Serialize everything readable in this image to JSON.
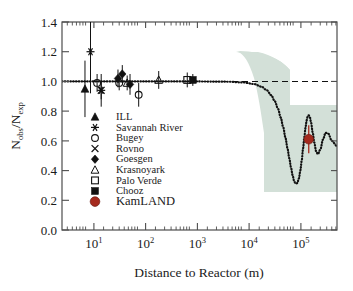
{
  "figure": {
    "background": "#ffffff",
    "frame_color": "#4d4d4d",
    "axes": {
      "x": {
        "title": "Distance to Reactor (m)",
        "scale": "log",
        "range": [
          3.16,
          630957
        ],
        "tick_bases": [
          "10",
          "10",
          "10",
          "10",
          "10"
        ],
        "tick_exponents": [
          "1",
          "2",
          "3",
          "4",
          "5"
        ],
        "tick_values": [
          10,
          100,
          1000,
          10000,
          100000
        ]
      },
      "y": {
        "title_main": "N",
        "title_sub1": "obs",
        "title_slash": "/N",
        "title_sub2": "exp",
        "title_plain": "Nobs/Nexp",
        "range": [
          0.0,
          1.4
        ],
        "ticks": [
          "0.0",
          "0.2",
          "0.4",
          "0.6",
          "0.8",
          "1.0",
          "1.2",
          "1.4"
        ],
        "tick_values": [
          0.0,
          0.2,
          0.4,
          0.6,
          0.8,
          1.0,
          1.2,
          1.4
        ]
      }
    },
    "reference_line": {
      "name": "no-oscillation-line",
      "y_value": 1.0,
      "style": "dashed",
      "color": "#111111"
    },
    "band": {
      "name": "oscillation-uncertainty-band",
      "color": "#d3e0d8",
      "label": "best-fit uncertainty region"
    },
    "curve": {
      "name": "oscillation-survival-curve",
      "style": "dotted",
      "color": "#111111"
    }
  },
  "legend": {
    "items": [
      {
        "label": "ILL",
        "marker": "filled-triangle-up",
        "color": "#111111"
      },
      {
        "label": "Savannah River",
        "marker": "asterisk",
        "color": "#111111"
      },
      {
        "label": "Bugey",
        "marker": "open-circle",
        "color": "#111111"
      },
      {
        "label": "Rovno",
        "marker": "cross-x",
        "color": "#111111"
      },
      {
        "label": "Goesgen",
        "marker": "filled-diamond",
        "color": "#111111"
      },
      {
        "label": "Krasnoyark",
        "marker": "open-triangle-up",
        "color": "#111111"
      },
      {
        "label": "Palo Verde",
        "marker": "open-square",
        "color": "#111111"
      },
      {
        "label": "Chooz",
        "marker": "filled-square",
        "color": "#111111"
      },
      {
        "label": "KamLAND",
        "marker": "filled-circle",
        "color": "#a52a1e",
        "emphasis": true
      }
    ]
  },
  "chart_data": {
    "type": "scatter",
    "title": "",
    "xlabel": "Distance to Reactor (m)",
    "ylabel": "Nobs/Nexp",
    "xscale": "log",
    "xlim": [
      3.16,
      630957
    ],
    "ylim": [
      0.0,
      1.4
    ],
    "grid": false,
    "legend_position": "inside-left",
    "reference_line_y": 1.0,
    "series": [
      {
        "name": "ILL",
        "marker": "filled-triangle-up",
        "color": "#111111",
        "points": [
          {
            "x": 8.76,
            "y": 0.95,
            "yerr": 0.19
          }
        ]
      },
      {
        "name": "Savannah River",
        "marker": "asterisk",
        "color": "#111111",
        "points": [
          {
            "x": 18.0,
            "y": 0.94,
            "yerr": 0.11
          },
          {
            "x": 11.2,
            "y": 1.2,
            "yerr": 0.28
          }
        ]
      },
      {
        "name": "Bugey",
        "marker": "open-circle",
        "color": "#111111",
        "points": [
          {
            "x": 15.0,
            "y": 0.99,
            "yerr": 0.06
          },
          {
            "x": 40.0,
            "y": 0.99,
            "yerr": 0.05
          },
          {
            "x": 95.0,
            "y": 0.91,
            "yerr": 0.08
          }
        ]
      },
      {
        "name": "Rovno",
        "marker": "cross-x",
        "color": "#111111",
        "points": [
          {
            "x": 18.0,
            "y": 0.94,
            "yerr": 0.06
          }
        ]
      },
      {
        "name": "Goesgen",
        "marker": "filled-diamond",
        "color": "#111111",
        "points": [
          {
            "x": 37.9,
            "y": 1.02,
            "yerr": 0.06
          },
          {
            "x": 45.9,
            "y": 1.05,
            "yerr": 0.06
          },
          {
            "x": 64.7,
            "y": 0.98,
            "yerr": 0.07
          }
        ]
      },
      {
        "name": "Krasnoyark",
        "marker": "open-triangle-up",
        "color": "#111111",
        "points": [
          {
            "x": 57.0,
            "y": 0.99,
            "yerr": 0.05
          },
          {
            "x": 231.0,
            "y": 1.01,
            "yerr": 0.06
          }
        ]
      },
      {
        "name": "Palo Verde",
        "marker": "open-square",
        "color": "#111111",
        "points": [
          {
            "x": 820.0,
            "y": 1.01,
            "yerr": 0.05
          }
        ]
      },
      {
        "name": "Chooz",
        "marker": "filled-square",
        "color": "#111111",
        "points": [
          {
            "x": 1050.0,
            "y": 1.01,
            "yerr": 0.04
          }
        ]
      },
      {
        "name": "KamLAND",
        "marker": "filled-circle",
        "color": "#a52a1e",
        "points": [
          {
            "x": 180000.0,
            "y": 0.611,
            "yerr": 0.094
          }
        ]
      }
    ],
    "oscillation_curve": {
      "name": "survival probability best fit",
      "style": "dotted",
      "x": [
        3.16,
        100,
        1000,
        5000,
        10000,
        16000,
        22000,
        28000,
        34000,
        40000,
        46000,
        52000,
        58000,
        64000,
        70000,
        76000,
        82000,
        88000,
        94000,
        100000,
        108000,
        116000,
        124000,
        132000,
        140000,
        148000,
        156000,
        164000,
        172000,
        180000,
        190000,
        200000,
        215000,
        230000,
        250000,
        270000,
        300000,
        340000,
        380000,
        430000,
        500000,
        630957
      ],
      "y": [
        1.0,
        1.0,
        1.0,
        0.998,
        0.993,
        0.982,
        0.965,
        0.941,
        0.908,
        0.866,
        0.816,
        0.757,
        0.692,
        0.622,
        0.551,
        0.482,
        0.42,
        0.368,
        0.331,
        0.312,
        0.315,
        0.346,
        0.4,
        0.47,
        0.548,
        0.624,
        0.69,
        0.738,
        0.766,
        0.772,
        0.757,
        0.722,
        0.655,
        0.589,
        0.53,
        0.51,
        0.54,
        0.61,
        0.655,
        0.648,
        0.6,
        0.565
      ]
    },
    "uncertainty_band": {
      "color": "#d3e0d8",
      "upper_y": 1.0,
      "lower_y": 0.24,
      "x_start": 10000,
      "x_end": 630957
    }
  }
}
